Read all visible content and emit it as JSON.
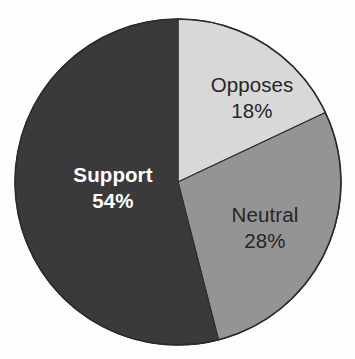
{
  "chart_data": {
    "type": "pie",
    "title": "",
    "subtitle": "",
    "xlabel": "",
    "ylabel": "",
    "legend_position": "none",
    "grid": false,
    "start_angle_deg": 0,
    "direction": "clockwise",
    "categories": [
      "Opposes",
      "Neutral",
      "Support"
    ],
    "values": [
      18,
      28,
      54
    ],
    "value_unit": "%",
    "slices": [
      {
        "label": "Opposes",
        "value": 18,
        "value_text": "18%",
        "color": "#d8d8d8",
        "label_color": "#262626",
        "label_weight": "normal",
        "start_deg": 0,
        "end_deg": 64.8,
        "label_x": 252,
        "label_y": 92,
        "value_x": 252,
        "value_y": 118
      },
      {
        "label": "Neutral",
        "value": 28,
        "value_text": "28%",
        "color": "#949494",
        "label_color": "#262626",
        "label_weight": "normal",
        "start_deg": 64.8,
        "end_deg": 165.6,
        "label_x": 265,
        "label_y": 222,
        "value_x": 265,
        "value_y": 248
      },
      {
        "label": "Support",
        "value": 54,
        "value_text": "54%",
        "color": "#3a3a3a",
        "label_color": "#ffffff",
        "label_weight": "bold",
        "start_deg": 165.6,
        "end_deg": 360,
        "label_x": 113,
        "label_y": 182,
        "value_x": 113,
        "value_y": 208
      }
    ],
    "geometry": {
      "center_x": 178,
      "center_y": 182,
      "radius": 163
    },
    "colors": {
      "background": "#fdfdfd",
      "outline": "#2b2b2b",
      "support": "#3a3a3a",
      "neutral": "#949494",
      "opposes": "#d8d8d8"
    }
  }
}
